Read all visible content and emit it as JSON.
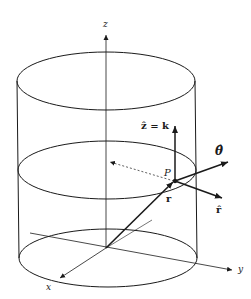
{
  "diagram": {
    "type": "cylindrical-coordinates",
    "labels": {
      "z_axis": "z",
      "x_axis": "x",
      "y_axis": "y",
      "point": "P",
      "position_vector": "r",
      "z_hat_eq_k": "ẑ = k",
      "theta_hat": "θ̂",
      "r_hat": "r̂"
    },
    "colors": {
      "stroke": "#1a1a1a",
      "background": "#ffffff"
    }
  }
}
